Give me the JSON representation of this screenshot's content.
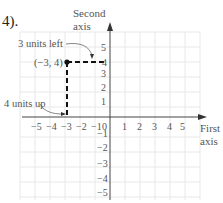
{
  "heading": "4).",
  "axes": {
    "y_label_line1": "Second",
    "y_label_line2": "axis",
    "x_label_line1": "First",
    "x_label_line2": "axis",
    "origin_label": "0",
    "x_ticks": [
      "−5",
      "−4",
      "−3",
      "−2",
      "−1",
      "1",
      "2",
      "3",
      "4",
      "5"
    ],
    "y_ticks_pos": [
      "1",
      "2",
      "3",
      "4",
      "5"
    ],
    "y_ticks_neg": [
      "−1",
      "−2",
      "−3",
      "−4",
      "−5"
    ]
  },
  "point": {
    "label": "(−3, 4)",
    "x": -3,
    "y": 4
  },
  "annotations": {
    "left": "3 units left",
    "up": "4 units up"
  },
  "colors": {
    "grid": "#e6e6e6",
    "axis": "#333333",
    "dash": "#111111",
    "text": "#555555"
  }
}
